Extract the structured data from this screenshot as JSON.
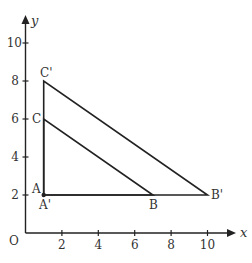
{
  "diagram": {
    "type": "coordinate-geometry-transformation",
    "axes": {
      "x_label": "x",
      "y_label": "y",
      "origin_label": "O",
      "x_ticks": [
        "2",
        "4",
        "6",
        "8",
        "10"
      ],
      "y_ticks": [
        "2",
        "4",
        "6",
        "8",
        "10"
      ]
    },
    "points": {
      "A": {
        "label": "A",
        "x": 1,
        "y": 2
      },
      "A_prime": {
        "label": "A'",
        "x": 1,
        "y": 2
      },
      "B": {
        "label": "B",
        "x": 7,
        "y": 2
      },
      "B_prime": {
        "label": "B'",
        "x": 10,
        "y": 2
      },
      "C": {
        "label": "C",
        "x": 1,
        "y": 6
      },
      "C_prime": {
        "label": "C'",
        "x": 1,
        "y": 8
      }
    },
    "triangles": [
      {
        "name": "ABC",
        "vertices": [
          "A",
          "B",
          "C"
        ]
      },
      {
        "name": "A'B'C'",
        "vertices": [
          "A'",
          "B'",
          "C'"
        ]
      }
    ],
    "colors": {
      "line": "#222222",
      "text": "#333333",
      "background": "#ffffff"
    }
  }
}
